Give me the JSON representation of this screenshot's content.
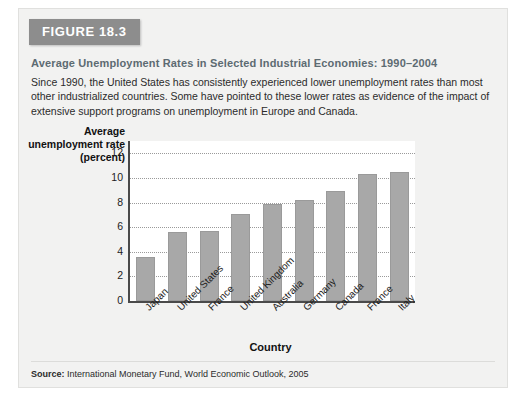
{
  "figure": {
    "badge": "FIGURE 18.3",
    "title": "Average Unemployment Rates in Selected Industrial Economies: 1990–2004",
    "description": "Since 1990, the United States has consistently experienced lower unemployment rates than most other industrialized countries. Some have pointed to these lower rates as evidence of the impact of extensive support programs on unemployment in Europe and Canada.",
    "source_label": "Source:",
    "source_text": "International Monetary Fund, World Economic Outlook, 2005"
  },
  "colors": {
    "card_background": "#f2f2f1",
    "badge_background": "#8d8d8d",
    "badge_text": "#ffffff",
    "title_text": "#5d6b72",
    "bar_fill": "#a8a8a8",
    "bar_stroke": "#9a9a9a",
    "axis_line": "#4a4a4a",
    "gridline": "#9a9a9a",
    "plot_background": "#ffffff"
  },
  "chart_data": {
    "type": "bar",
    "title": "",
    "xlabel": "Country",
    "ylabel": "Average unemployment rate (percent)",
    "categories": [
      "Japan",
      "United States",
      "France",
      "United Kingdom",
      "Australia",
      "Germany",
      "Canada",
      "France",
      "Italy"
    ],
    "values": [
      3.6,
      5.6,
      5.7,
      7.1,
      7.9,
      8.2,
      8.9,
      10.3,
      10.5
    ],
    "ylim": [
      0,
      13
    ],
    "yticks": [
      0,
      2,
      4,
      6,
      8,
      10,
      12
    ],
    "ytick_labels": [
      "0",
      "2",
      "4",
      "6",
      "8",
      "10",
      "12"
    ],
    "grid": true,
    "grid_axis": "y",
    "legend": false
  }
}
